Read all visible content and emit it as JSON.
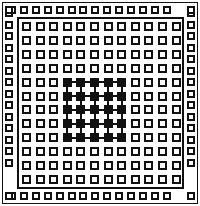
{
  "figure": {
    "title": "",
    "kind": "grid-array-package-diagram",
    "width": 200,
    "height": 206,
    "background_color": "#ffffff",
    "ink_color": "#111111"
  },
  "outer_frame": {
    "name": "package-outline",
    "x": 2,
    "y": 2,
    "width": 196,
    "height": 202,
    "stroke": "#111111",
    "stroke_width": 1
  },
  "inner_frame": {
    "name": "die-outline",
    "x": 17,
    "y": 17,
    "width": 167,
    "height": 172,
    "stroke": "#111111",
    "stroke_width": 2
  },
  "outer_ring": {
    "name": "perimeter-pad-ring",
    "columns": 16,
    "rows": 16,
    "pad_size": 8,
    "pad_fill": "#ffffff",
    "pad_stroke": "#111111",
    "top_y": 6,
    "bottom_y": 192,
    "left_x": 5,
    "right_x": 187,
    "col_start": 8,
    "col_pitch": 11.9,
    "row_start": 9,
    "row_pitch": 11.5,
    "side_count": 14,
    "corner_pads": 4,
    "total_pads": 60
  },
  "inner_grid": {
    "name": "core-pad-array",
    "columns": 12,
    "rows": 12,
    "pad_size": 9,
    "origin_x": 22,
    "origin_y": 22,
    "pitch_x": 13.6,
    "pitch_y": 13.9,
    "total_pads": 144,
    "empty_fill": "#ffffff",
    "filled_fill": "#111111"
  },
  "highlight_block": {
    "name": "selected-pad-block",
    "col_start": 4,
    "col_end": 8,
    "row_start": 5,
    "row_end": 9,
    "columns": 5,
    "rows": 5,
    "count": 25,
    "fill": "#111111",
    "connected": true,
    "trace_width": 2,
    "description": "5x5 block of filled pads joined by horizontal and vertical traces"
  },
  "legend": {
    "filled_label": "",
    "empty_label": ""
  }
}
